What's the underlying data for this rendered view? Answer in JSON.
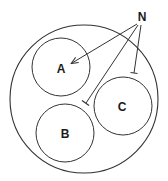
{
  "diagram": {
    "outer_circle": {
      "cx": 84,
      "cy": 99,
      "r": 74
    },
    "nodes": [
      {
        "id": "A",
        "label": "A",
        "cx": 61,
        "cy": 67,
        "r": 29,
        "label_x": 61,
        "label_y": 73
      },
      {
        "id": "B",
        "label": "B",
        "cx": 65,
        "cy": 133,
        "r": 29,
        "label_x": 65,
        "label_y": 138
      },
      {
        "id": "C",
        "label": "C",
        "cx": 123,
        "cy": 106,
        "r": 29,
        "label_x": 122,
        "label_y": 111
      }
    ],
    "source": {
      "label": "N",
      "x": 142,
      "y": 21
    },
    "edges": [
      {
        "from": "N",
        "to": "A",
        "type": "arrow"
      },
      {
        "from": "N",
        "to": "B",
        "type": "inhibit"
      },
      {
        "from": "N",
        "to": "C",
        "type": "inhibit"
      }
    ],
    "colors": {
      "stroke": "#333333",
      "text": "#1a1a1a",
      "background": "#ffffff"
    }
  }
}
